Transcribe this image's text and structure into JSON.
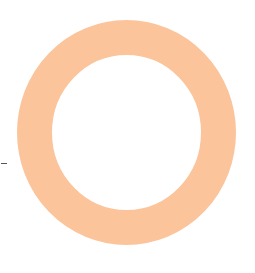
{
  "figure": {
    "shape": "ring",
    "colors": {
      "ring": "#fbc49a",
      "background": "#ffffff",
      "dash": "#555555"
    },
    "ring": {
      "center_x": 126.5,
      "center_y": 132.5,
      "outer_radius_x": 109.5,
      "outer_radius_y": 112.5,
      "thickness": 35
    },
    "dash": {
      "x": 1,
      "y": 163,
      "length": 6
    }
  }
}
